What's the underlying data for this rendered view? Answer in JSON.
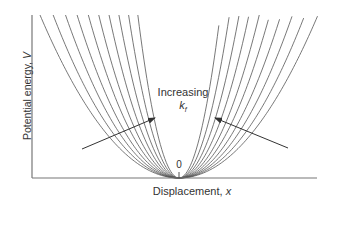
{
  "diagram": {
    "title": "",
    "y_axis_label": "Potential energy, ",
    "y_axis_var": "V",
    "x_axis_label": "Displacement, ",
    "x_axis_var": "x",
    "origin_label": "0",
    "annotation_line1": "Increasing",
    "annotation_line2": "k",
    "annotation_sub": "f",
    "curve_count": 10,
    "colors": {
      "axis": "#777777",
      "curve": "#555555",
      "arrow": "#333333",
      "text": "#333333"
    }
  },
  "chart_data": {
    "type": "line",
    "title": "",
    "xlabel": "Displacement, x",
    "ylabel": "Potential energy, V",
    "x_ticks": [
      "0"
    ],
    "series": [
      {
        "name": "k_f 1",
        "relative_k": 1.0
      },
      {
        "name": "k_f 2",
        "relative_k": 1.22
      },
      {
        "name": "k_f 3",
        "relative_k": 1.5
      },
      {
        "name": "k_f 4",
        "relative_k": 1.86
      },
      {
        "name": "k_f 5",
        "relative_k": 2.35
      },
      {
        "name": "k_f 6",
        "relative_k": 3.0
      },
      {
        "name": "k_f 7",
        "relative_k": 3.95
      },
      {
        "name": "k_f 8",
        "relative_k": 5.35
      },
      {
        "name": "k_f 9",
        "relative_k": 7.6
      },
      {
        "name": "k_f 10",
        "relative_k": 11.4
      }
    ],
    "annotations": [
      "Increasing k_f"
    ],
    "grid": false,
    "legend": "none"
  }
}
